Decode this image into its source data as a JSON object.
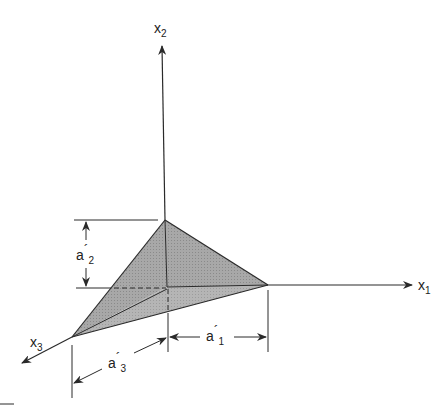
{
  "figure": {
    "type": "3D intercept plane diagram",
    "axes": {
      "x1": {
        "base": "x",
        "sub": "1"
      },
      "x2": {
        "base": "x",
        "sub": "2"
      },
      "x3": {
        "base": "x",
        "sub": "3"
      }
    },
    "dimensions": {
      "a1": {
        "base": "a",
        "prime": "´",
        "sub": "1"
      },
      "a2": {
        "base": "a",
        "prime": "´",
        "sub": "2"
      },
      "a3": {
        "base": "a",
        "prime": "´",
        "sub": "3"
      }
    },
    "colors": {
      "line": "#2a2a2a",
      "plane_fill": "#9a9a9a",
      "plane_fill_light": "#b3b3b3",
      "background": "#ffffff"
    }
  }
}
